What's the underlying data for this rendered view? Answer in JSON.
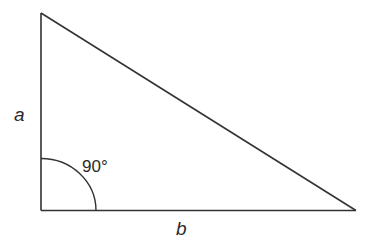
{
  "diagram": {
    "type": "right-triangle",
    "labels": {
      "side_a": "a",
      "side_b": "b",
      "angle": "90°"
    },
    "vertices": {
      "top": [
        41,
        13
      ],
      "right_angle": [
        41,
        210
      ],
      "right": [
        356,
        211
      ]
    },
    "colors": {
      "stroke": "#333333",
      "background": "#ffffff"
    }
  }
}
